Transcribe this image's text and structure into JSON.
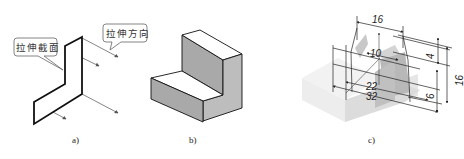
{
  "figure": {
    "panels": [
      {
        "id": "a",
        "caption": "a)",
        "callouts": [
          {
            "label": "拉伸截面",
            "meaning": "extrusion section"
          },
          {
            "label": "拉伸方向",
            "meaning": "extrusion direction"
          }
        ]
      },
      {
        "id": "b",
        "caption": "b)"
      },
      {
        "id": "c",
        "caption": "c)",
        "dimensions": [
          "16",
          "10",
          "4",
          "16",
          "6",
          "22",
          "32"
        ]
      }
    ]
  }
}
